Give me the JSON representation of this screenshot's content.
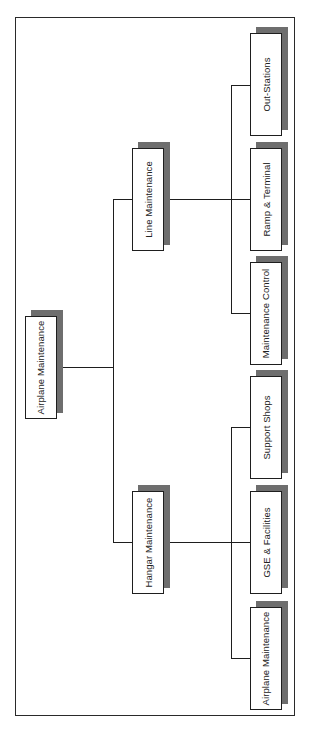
{
  "diagram": {
    "type": "org-chart",
    "orientation": "rotated-90-ccw",
    "root": {
      "label": "Airplane Maintenance"
    },
    "level1": [
      {
        "label": "Line Maintenance"
      },
      {
        "label": "Hangar Maintenance"
      }
    ],
    "line_children": [
      {
        "label": "Out-Stations"
      },
      {
        "label": "Ramp & Terminal"
      },
      {
        "label": "Maintenance Control"
      }
    ],
    "hangar_children": [
      {
        "label": "Support Shops"
      },
      {
        "label": "GSE & Facilities"
      },
      {
        "label": "Airplane Maintenance"
      }
    ],
    "colors": {
      "line": "#1e1e1e",
      "box_fill": "#ffffff",
      "shadow": "#6e6e6e",
      "frame": "#2a2a2a"
    }
  }
}
